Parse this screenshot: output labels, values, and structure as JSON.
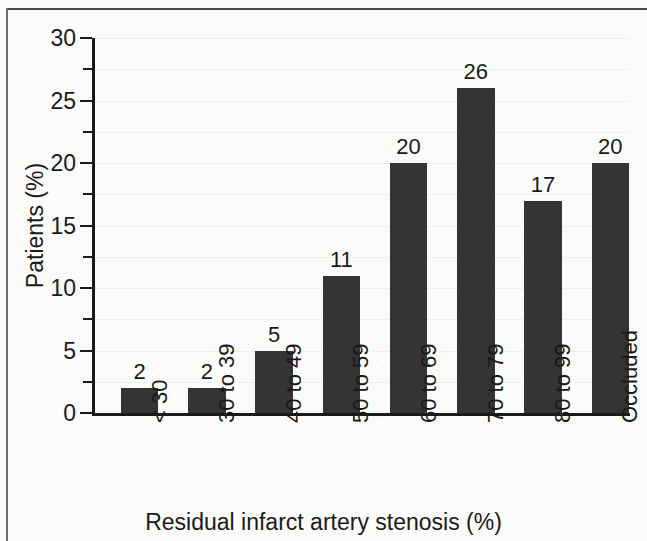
{
  "chart_data": {
    "type": "bar",
    "title": "",
    "xlabel": "Residual infarct artery stenosis (%)",
    "ylabel": "Patients (%)",
    "categories": [
      "< 30",
      "30 to 39",
      "40 to 49",
      "50 to 59",
      "60 to 69",
      "70 to 79",
      "80 to 99",
      "Occluded"
    ],
    "values": [
      2,
      2,
      5,
      11,
      20,
      26,
      17,
      20
    ],
    "value_labels": [
      "2",
      "2",
      "5",
      "11",
      "20",
      "26",
      "17",
      "20"
    ],
    "ylim": [
      0,
      30
    ],
    "ytick_labels": [
      "0",
      "5",
      "10",
      "15",
      "20",
      "25",
      "30"
    ],
    "ytick_values": [
      0,
      5,
      10,
      15,
      20,
      25,
      30
    ],
    "yminor_values": [
      2.5,
      7.5,
      12.5,
      17.5,
      22.5,
      27.5
    ],
    "grid": true,
    "legend": "none",
    "bar_color": "#343434",
    "axis_color": "#1a1a1a",
    "background_color": "#fbfbfa",
    "gridline_color": "#f0efee"
  }
}
